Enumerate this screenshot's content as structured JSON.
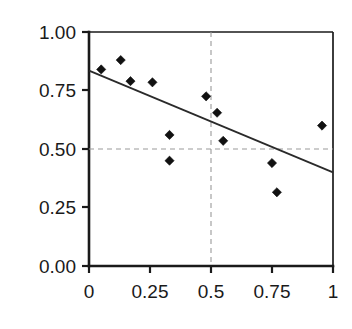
{
  "chart_data": {
    "type": "scatter",
    "title": "",
    "subtitle": "",
    "xlabel": "",
    "ylabel": "",
    "xlim": [
      0,
      1
    ],
    "ylim": [
      0,
      1
    ],
    "grid": "dashed reference lines at x=0.5 and y=0.50",
    "legend": "none",
    "x_ticks": [
      0,
      0.25,
      0.5,
      0.75,
      1
    ],
    "y_ticks": [
      0,
      0.25,
      0.5,
      0.75,
      1
    ],
    "x_tick_labels": [
      "0",
      "0.25",
      "0.5",
      "0.75",
      "1"
    ],
    "y_tick_labels": [
      "0.00",
      "0.25",
      "0.50",
      "0.75",
      "1.00"
    ],
    "marker_style": "filled diamond",
    "marker_color": "#111111",
    "points": [
      {
        "x": 0.05,
        "y": 0.84
      },
      {
        "x": 0.13,
        "y": 0.88
      },
      {
        "x": 0.17,
        "y": 0.79
      },
      {
        "x": 0.26,
        "y": 0.785
      },
      {
        "x": 0.33,
        "y": 0.56
      },
      {
        "x": 0.33,
        "y": 0.45
      },
      {
        "x": 0.48,
        "y": 0.725
      },
      {
        "x": 0.525,
        "y": 0.655
      },
      {
        "x": 0.55,
        "y": 0.535
      },
      {
        "x": 0.75,
        "y": 0.44
      },
      {
        "x": 0.77,
        "y": 0.315
      },
      {
        "x": 0.955,
        "y": 0.6
      }
    ],
    "series": [
      {
        "name": "observations",
        "x": [
          0.05,
          0.13,
          0.17,
          0.26,
          0.33,
          0.33,
          0.48,
          0.525,
          0.55,
          0.75,
          0.77,
          0.955
        ],
        "values": [
          0.84,
          0.88,
          0.79,
          0.785,
          0.56,
          0.45,
          0.725,
          0.655,
          0.535,
          0.44,
          0.315,
          0.6
        ]
      }
    ],
    "trend_line": {
      "name": "fitted regression line",
      "type": "line",
      "x": [
        0,
        1
      ],
      "values": [
        0.835,
        0.4
      ],
      "intercept": 0.835,
      "slope": -0.435,
      "color": "#2a2a2a"
    },
    "reference_lines": [
      {
        "orientation": "vertical",
        "value": 0.5,
        "style": "dashed",
        "color": "#9a9a9a"
      },
      {
        "orientation": "horizontal",
        "value": 0.5,
        "style": "dashed",
        "color": "#9a9a9a"
      }
    ]
  },
  "axes": {
    "x_labels": [
      "0",
      "0.25",
      "0.5",
      "0.75",
      "1"
    ],
    "y_labels": [
      "1.00",
      "0.75",
      "0.50",
      "0.25",
      "0.00"
    ]
  }
}
